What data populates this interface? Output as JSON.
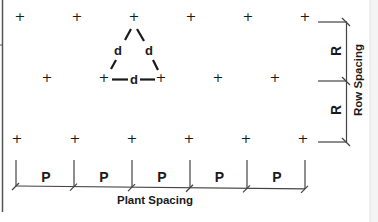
{
  "diagram": {
    "colors": {
      "ink": "#1a1a1a",
      "line": "#444444",
      "frame": "#555555",
      "right_strip": "#eeeeee"
    },
    "plant_symbol": "+",
    "rows": [
      {
        "y": 21,
        "plants_x": [
          20,
          77,
          134,
          191,
          248,
          305
        ]
      },
      {
        "y": 82,
        "plants_x": [
          47,
          104,
          161,
          218,
          275
        ]
      },
      {
        "y": 143,
        "plants_x": [
          17,
          75,
          132,
          189,
          246,
          303
        ]
      }
    ],
    "triangle": {
      "distance_label": "d",
      "vertices": [
        [
          134,
          21
        ],
        [
          104,
          82
        ],
        [
          161,
          82
        ]
      ]
    },
    "row_spacing": {
      "title": "Row Spacing",
      "segment_label": "R",
      "segments": 2
    },
    "plant_spacing": {
      "title": "Plant Spacing",
      "segment_label": "P",
      "segments": 5,
      "ticks_x": [
        16,
        74,
        132,
        190,
        247,
        305
      ]
    }
  }
}
